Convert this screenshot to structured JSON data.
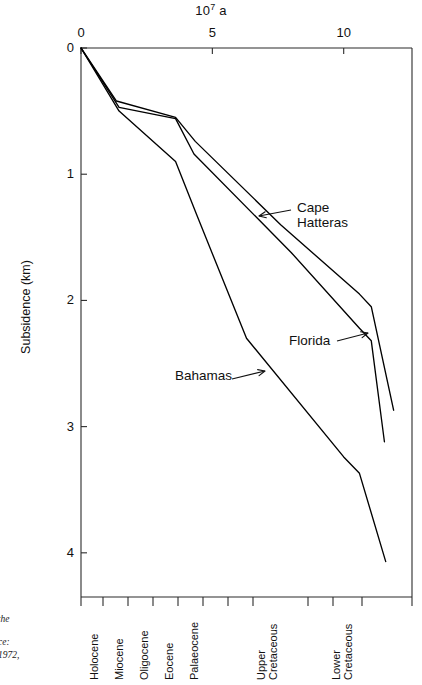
{
  "chart_data": {
    "type": "line",
    "title_display": "10",
    "title_exponent": "7",
    "title_unit": "a",
    "xlabel": "",
    "ylabel": "Subsidence (km)",
    "xlim": [
      0,
      12.6
    ],
    "ylim": [
      0,
      4.35
    ],
    "y_axis_inverted": true,
    "grid": false,
    "legend": "inline-annotations",
    "x_ticks": [
      0,
      5,
      10
    ],
    "x_tick_labels": [
      "0",
      "5",
      "10"
    ],
    "y_ticks": [
      0,
      1,
      2,
      3,
      4
    ],
    "y_tick_labels": [
      "0",
      "1",
      "2",
      "3",
      "4"
    ],
    "x_unit": "10^7 years",
    "y_unit": "km",
    "series": [
      {
        "name": "Cape Hatteras",
        "x": [
          0.0,
          1.35,
          3.6,
          4.35,
          7.6,
          10.6,
          11.05,
          11.9
        ],
        "y": [
          0.0,
          0.42,
          0.55,
          0.74,
          1.4,
          1.95,
          2.05,
          2.87
        ]
      },
      {
        "name": "Florida",
        "x": [
          0.0,
          1.45,
          3.6,
          4.3,
          8.0,
          10.6,
          11.05,
          11.55
        ],
        "y": [
          0.0,
          0.47,
          0.56,
          0.84,
          1.62,
          2.22,
          2.32,
          3.12
        ]
      },
      {
        "name": "Bahamas",
        "x": [
          0.0,
          1.45,
          3.6,
          4.4,
          6.3,
          10.0,
          10.6,
          11.6
        ],
        "y": [
          0.0,
          0.5,
          0.9,
          1.32,
          2.3,
          3.24,
          3.37,
          4.07
        ]
      }
    ],
    "periods": [
      {
        "label": "Holocene",
        "lines": [
          "Holocene"
        ]
      },
      {
        "label": "Miocene",
        "lines": [
          "Miocene"
        ]
      },
      {
        "label": "Oligocene",
        "lines": [
          "Oligocene"
        ]
      },
      {
        "label": "Eocene",
        "lines": [
          "Eocene"
        ]
      },
      {
        "label": "Palaeocene",
        "lines": [
          "Palaeocene"
        ]
      },
      {
        "label": "Upper Cretaceous",
        "lines": [
          "Upper",
          "Cretaceous"
        ]
      },
      {
        "label": "Lower Cretaceous",
        "lines": [
          "Lower",
          "Cretaceous"
        ]
      }
    ],
    "annotations": [
      {
        "name": "Cape Hatteras",
        "lines": [
          "Cape",
          "Hatteras"
        ],
        "arrow": "left"
      },
      {
        "name": "Florida",
        "lines": [
          "Florida"
        ],
        "arrow": "right"
      },
      {
        "name": "Bahamas",
        "lines": [
          "Bahamas"
        ],
        "arrow": "right"
      }
    ],
    "line_color": "#000000"
  },
  "source_caption": {
    "line1": "E",
    "line2": "of the",
    "line3": "urce:",
    "line4": "1972,"
  }
}
